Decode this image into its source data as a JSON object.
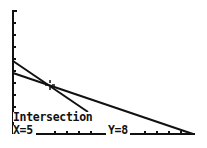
{
  "screen": {
    "type": "graphing-calculator",
    "mode": "intersect"
  },
  "result": {
    "title": "Intersection",
    "x_label": "X=5",
    "y_label": "Y=8",
    "x": 5,
    "y": 8
  },
  "graph": {
    "axis_color": "#111111",
    "line_color": "#111111",
    "background": "#ffffff",
    "y_axis": {
      "x_px": 13,
      "top_px": 10,
      "bottom_px": 134,
      "tick_spacing_px": 12
    },
    "x_axis": {
      "y_px": 134,
      "left_px": 13,
      "right_px": 195,
      "tick_spacing_px": 12
    },
    "lines": [
      {
        "name": "Y1",
        "from": [
          13,
          61
        ],
        "to": [
          88,
          112
        ]
      },
      {
        "name": "Y2",
        "from": [
          13,
          73
        ],
        "to": [
          193,
          134
        ]
      }
    ],
    "cursor": {
      "x_px": 50,
      "y_px": 85
    }
  }
}
